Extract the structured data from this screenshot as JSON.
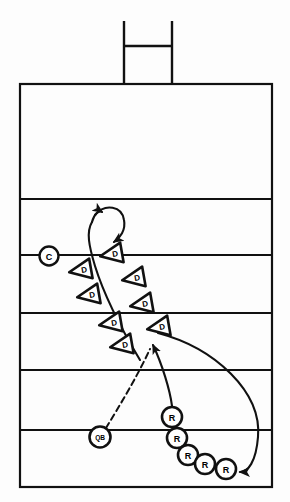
{
  "diagram": {
    "type": "play-diagram",
    "sport": "american-football",
    "colors": {
      "ink": "#111111",
      "paper": "#fdfdfd",
      "marker_fill": "#ffffff"
    },
    "field": {
      "left": 20,
      "right": 272,
      "top": 84,
      "bottom": 487,
      "yard_lines_y": [
        199,
        255,
        313,
        370,
        430
      ],
      "border_width": 2.2,
      "line_width": 2.0
    },
    "goalpost": {
      "label": "goalpost",
      "left_upright_x": 124,
      "right_upright_x": 172,
      "crossbar_y": 46,
      "top_y": 21,
      "base_y": 84
    },
    "markers": {
      "center": {
        "label": "C",
        "name": "center-marker",
        "x": 49,
        "y": 256,
        "r": 9.5
      },
      "quarterback": {
        "label": "QB",
        "name": "quarterback-marker",
        "x": 100,
        "y": 437,
        "r": 10.5
      },
      "receivers": [
        {
          "label": "R",
          "x": 172,
          "y": 417,
          "r": 10
        },
        {
          "label": "R",
          "x": 177,
          "y": 438,
          "r": 10
        },
        {
          "label": "R",
          "x": 188,
          "y": 455,
          "r": 10
        },
        {
          "label": "R",
          "x": 205,
          "y": 464,
          "r": 10
        },
        {
          "label": "R",
          "x": 226,
          "y": 469,
          "r": 10
        }
      ],
      "defenders": [
        {
          "label": "D",
          "x": 82,
          "y": 270,
          "size": 15,
          "rot": -10
        },
        {
          "label": "D",
          "x": 90,
          "y": 295,
          "size": 15,
          "rot": -10
        },
        {
          "label": "D",
          "x": 112,
          "y": 323,
          "size": 15,
          "rot": -10
        },
        {
          "label": "D",
          "x": 123,
          "y": 345,
          "size": 15,
          "rot": -10
        },
        {
          "label": "D",
          "x": 113,
          "y": 254,
          "size": 15,
          "rot": -10
        },
        {
          "label": "D",
          "x": 135,
          "y": 278,
          "size": 15,
          "rot": -10
        },
        {
          "label": "D",
          "x": 143,
          "y": 304,
          "size": 15,
          "rot": -10
        },
        {
          "label": "D",
          "x": 160,
          "y": 327,
          "size": 15,
          "rot": -10
        }
      ]
    },
    "routes": [
      {
        "name": "loop-route",
        "style": "solid",
        "description": "looping curl route above the defensive line"
      },
      {
        "name": "qb-dashed-route",
        "style": "dashed",
        "description": "quarterback pass path to target"
      },
      {
        "name": "receiver-drive-route",
        "style": "solid",
        "description": "receiver path up toward the defensive line"
      },
      {
        "name": "sweep-route",
        "style": "solid",
        "description": "long sweeping route from the line around to the wide receivers"
      }
    ]
  }
}
